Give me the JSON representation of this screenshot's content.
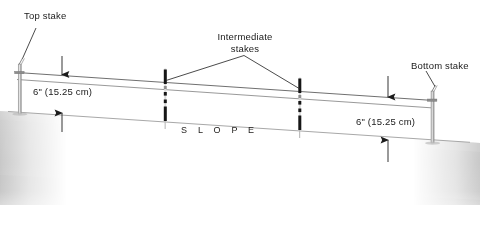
{
  "figure": {
    "labels": {
      "top_stake": "Top stake",
      "intermediate_stakes_line1": "Intermediate",
      "intermediate_stakes_line2": "stakes",
      "bottom_stake": "Bottom stake",
      "dimension_left": "6\" (15.25 cm)",
      "dimension_right": "6\" (15.25 cm)",
      "slope": "S L O P E"
    },
    "measurements": [
      {
        "name": "left-drop",
        "value": "6\" (15.25 cm)",
        "inches": 6,
        "centimeters": 15.25
      },
      {
        "name": "right-drop",
        "value": "6\" (15.25 cm)",
        "inches": 6,
        "centimeters": 15.25
      }
    ],
    "stakes": [
      {
        "name": "top-stake",
        "type": "tall-post",
        "x": 20
      },
      {
        "name": "intermediate-stake-1",
        "type": "dark-bar",
        "x": 166
      },
      {
        "name": "intermediate-stake-2",
        "type": "dark-bar",
        "x": 300
      },
      {
        "name": "bottom-stake",
        "type": "tall-post",
        "x": 432
      }
    ],
    "colors": {
      "ground": "#c9c9c9",
      "ground_top": "#d6d6d6",
      "string_line": "#6e6e6e",
      "stake_dark": "#1b1b1b",
      "text": "#1a1a1a",
      "background": "#ffffff",
      "leader": "#2b2b2b"
    }
  }
}
